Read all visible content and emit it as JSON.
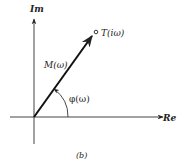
{
  "diagram": {
    "type": "complex-plane-phasor",
    "axes": {
      "imaginary_label": "Im",
      "real_label": "Re"
    },
    "vector": {
      "magnitude_label": "M(ω)",
      "angle_label": "φ(ω)",
      "endpoint_label": "T(iω)"
    },
    "caption": "(b)",
    "colors": {
      "ink": "#222222",
      "background": "#ffffff"
    }
  }
}
